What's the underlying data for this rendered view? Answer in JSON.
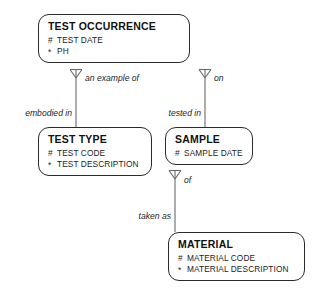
{
  "diagram": {
    "notation": "barker-erd",
    "marker_uid": "#",
    "marker_mandatory": "*",
    "line_color": "#6a6a6a",
    "box_border_color": "#2b2b2b",
    "background": "#ffffff"
  },
  "entities": [
    {
      "id": "test-occurrence",
      "title": "TEST OCCURRENCE",
      "attributes": [
        {
          "marker": "#",
          "name": "TEST DATE"
        },
        {
          "marker": "*",
          "name": "PH"
        }
      ]
    },
    {
      "id": "test-type",
      "title": "TEST TYPE",
      "attributes": [
        {
          "marker": "#",
          "name": "TEST CODE"
        },
        {
          "marker": "*",
          "name": "TEST DESCRIPTION"
        }
      ]
    },
    {
      "id": "sample",
      "title": "SAMPLE",
      "attributes": [
        {
          "marker": "#",
          "name": "SAMPLE DATE"
        }
      ]
    },
    {
      "id": "material",
      "title": "MATERIAL",
      "attributes": [
        {
          "marker": "#",
          "name": "MATERIAL CODE"
        },
        {
          "marker": "*",
          "name": "MATERIAL DESCRIPTION"
        }
      ]
    }
  ],
  "relationships": [
    {
      "id": "occurrence-type",
      "from": "test-occurrence",
      "to": "test-type",
      "label_from": "an example of",
      "label_to": "embodied in"
    },
    {
      "id": "occurrence-sample",
      "from": "test-occurrence",
      "to": "sample",
      "label_from": "on",
      "label_to": "tested in"
    },
    {
      "id": "sample-material",
      "from": "sample",
      "to": "material",
      "label_from": "of",
      "label_to": "taken as"
    }
  ]
}
